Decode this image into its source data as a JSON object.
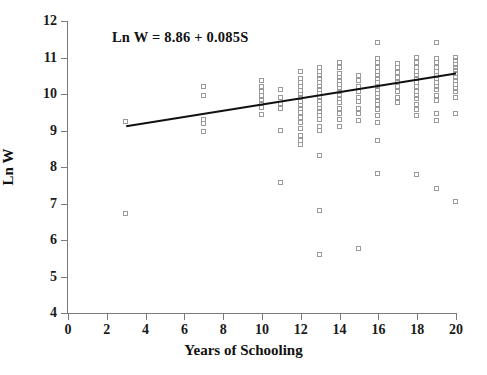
{
  "chart_data": {
    "type": "scatter",
    "title": "",
    "xlabel": "Years of Schooling",
    "ylabel": "Ln W",
    "xlim": [
      0,
      20
    ],
    "ylim": [
      4,
      12
    ],
    "xticks": [
      0,
      2,
      4,
      6,
      8,
      10,
      12,
      14,
      16,
      18,
      20
    ],
    "yticks": [
      4,
      5,
      6,
      7,
      8,
      9,
      10,
      11,
      12
    ],
    "grid": false,
    "legend": null,
    "annotations": [
      {
        "text": "Ln W = 8.86 + 0.085S",
        "x": 5.3,
        "y": 11.62
      }
    ],
    "fit_line": {
      "type": "line",
      "equation": "Ln W = 8.86 + 0.085S",
      "intercept": 8.86,
      "slope": 0.085,
      "x_start": 3,
      "x_end": 20,
      "y_start": 9.115,
      "y_end": 10.56,
      "color": "#111111"
    },
    "marker": {
      "shape": "open-square",
      "size": 5,
      "edge_color": "#9a9a9a",
      "fill": "none"
    },
    "points": [
      [
        3,
        9.22
      ],
      [
        3,
        6.72
      ],
      [
        7,
        10.2
      ],
      [
        7,
        9.95
      ],
      [
        7,
        9.28
      ],
      [
        7,
        9.18
      ],
      [
        7,
        8.95
      ],
      [
        10,
        10.35
      ],
      [
        10,
        10.2
      ],
      [
        10,
        10.05
      ],
      [
        10,
        9.95
      ],
      [
        10,
        9.8
      ],
      [
        10,
        9.72
      ],
      [
        10,
        9.62
      ],
      [
        10,
        9.42
      ],
      [
        11,
        10.1
      ],
      [
        11,
        9.9
      ],
      [
        11,
        9.72
      ],
      [
        11,
        9.58
      ],
      [
        11,
        9.0
      ],
      [
        11,
        7.55
      ],
      [
        12,
        10.6
      ],
      [
        12,
        10.42
      ],
      [
        12,
        10.3
      ],
      [
        12,
        10.2
      ],
      [
        12,
        10.08
      ],
      [
        12,
        9.98
      ],
      [
        12,
        9.88
      ],
      [
        12,
        9.78
      ],
      [
        12,
        9.68
      ],
      [
        12,
        9.58
      ],
      [
        12,
        9.48
      ],
      [
        12,
        9.35
      ],
      [
        12,
        9.2
      ],
      [
        12,
        9.05
      ],
      [
        12,
        8.85
      ],
      [
        12,
        8.72
      ],
      [
        12,
        8.6
      ],
      [
        13,
        10.72
      ],
      [
        13,
        10.6
      ],
      [
        13,
        10.5
      ],
      [
        13,
        10.4
      ],
      [
        13,
        10.3
      ],
      [
        13,
        10.2
      ],
      [
        13,
        10.1
      ],
      [
        13,
        10.0
      ],
      [
        13,
        9.9
      ],
      [
        13,
        9.8
      ],
      [
        13,
        9.7
      ],
      [
        13,
        9.6
      ],
      [
        13,
        9.5
      ],
      [
        13,
        9.4
      ],
      [
        13,
        9.3
      ],
      [
        13,
        9.1
      ],
      [
        13,
        8.98
      ],
      [
        13,
        8.3
      ],
      [
        13,
        6.8
      ],
      [
        13,
        5.6
      ],
      [
        14,
        10.85
      ],
      [
        14,
        10.7
      ],
      [
        14,
        10.55
      ],
      [
        14,
        10.45
      ],
      [
        14,
        10.35
      ],
      [
        14,
        10.25
      ],
      [
        14,
        10.15
      ],
      [
        14,
        10.05
      ],
      [
        14,
        9.95
      ],
      [
        14,
        9.85
      ],
      [
        14,
        9.75
      ],
      [
        14,
        9.6
      ],
      [
        14,
        9.45
      ],
      [
        14,
        9.3
      ],
      [
        14,
        9.1
      ],
      [
        15,
        10.5
      ],
      [
        15,
        10.35
      ],
      [
        15,
        10.2
      ],
      [
        15,
        10.05
      ],
      [
        15,
        9.9
      ],
      [
        15,
        9.78
      ],
      [
        15,
        9.6
      ],
      [
        15,
        9.45
      ],
      [
        15,
        9.25
      ],
      [
        15,
        5.75
      ],
      [
        16,
        11.4
      ],
      [
        16,
        10.95
      ],
      [
        16,
        10.85
      ],
      [
        16,
        10.72
      ],
      [
        16,
        10.6
      ],
      [
        16,
        10.5
      ],
      [
        16,
        10.4
      ],
      [
        16,
        10.3
      ],
      [
        16,
        10.2
      ],
      [
        16,
        10.1
      ],
      [
        16,
        10.0
      ],
      [
        16,
        9.9
      ],
      [
        16,
        9.8
      ],
      [
        16,
        9.7
      ],
      [
        16,
        9.55
      ],
      [
        16,
        9.4
      ],
      [
        16,
        9.2
      ],
      [
        16,
        8.7
      ],
      [
        16,
        7.8
      ],
      [
        17,
        10.82
      ],
      [
        17,
        10.7
      ],
      [
        17,
        10.58
      ],
      [
        17,
        10.45
      ],
      [
        17,
        10.3
      ],
      [
        17,
        10.18
      ],
      [
        17,
        10.05
      ],
      [
        17,
        9.9
      ],
      [
        17,
        9.75
      ],
      [
        18,
        11.0
      ],
      [
        18,
        10.85
      ],
      [
        18,
        10.72
      ],
      [
        18,
        10.6
      ],
      [
        18,
        10.5
      ],
      [
        18,
        10.4
      ],
      [
        18,
        10.3
      ],
      [
        18,
        10.18
      ],
      [
        18,
        10.05
      ],
      [
        18,
        9.95
      ],
      [
        18,
        9.85
      ],
      [
        18,
        9.7
      ],
      [
        18,
        9.55
      ],
      [
        18,
        9.4
      ],
      [
        18,
        7.78
      ],
      [
        19,
        11.4
      ],
      [
        19,
        10.95
      ],
      [
        19,
        10.85
      ],
      [
        19,
        10.72
      ],
      [
        19,
        10.6
      ],
      [
        19,
        10.5
      ],
      [
        19,
        10.4
      ],
      [
        19,
        10.3
      ],
      [
        19,
        10.2
      ],
      [
        19,
        10.1
      ],
      [
        19,
        9.95
      ],
      [
        19,
        9.8
      ],
      [
        19,
        9.45
      ],
      [
        19,
        9.25
      ],
      [
        19,
        7.4
      ],
      [
        20,
        11.0
      ],
      [
        20,
        10.9
      ],
      [
        20,
        10.8
      ],
      [
        20,
        10.7
      ],
      [
        20,
        10.62
      ],
      [
        20,
        10.55
      ],
      [
        20,
        10.45
      ],
      [
        20,
        10.35
      ],
      [
        20,
        10.25
      ],
      [
        20,
        10.15
      ],
      [
        20,
        10.05
      ],
      [
        20,
        9.9
      ],
      [
        20,
        9.45
      ],
      [
        20,
        7.05
      ]
    ]
  }
}
